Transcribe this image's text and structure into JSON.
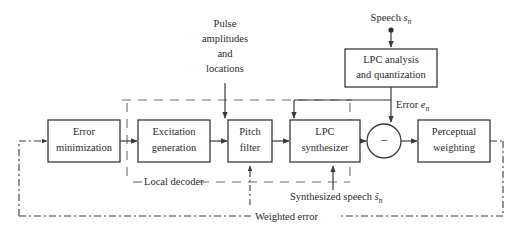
{
  "figure": {
    "type": "block-diagram",
    "title_text": "",
    "stroke_color": "#3a3a3a",
    "text_color": "#2b2b2b",
    "background": "#ffffff"
  },
  "blocks": [
    {
      "id": "error-minimization",
      "line1": "Error",
      "line2": "minimization",
      "x": 48,
      "y": 120,
      "w": 72,
      "h": 42
    },
    {
      "id": "excitation-generation",
      "line1": "Excitation",
      "line2": "generation",
      "x": 138,
      "y": 120,
      "w": 72,
      "h": 42
    },
    {
      "id": "pitch-filter",
      "line1": "Pitch",
      "line2": "filter",
      "x": 228,
      "y": 120,
      "w": 44,
      "h": 42
    },
    {
      "id": "lpc-synthesizer",
      "line1": "LPC",
      "line2": "synthesizer",
      "x": 290,
      "y": 120,
      "w": 70,
      "h": 42
    },
    {
      "id": "perceptual-weighting",
      "line1": "Perceptual",
      "line2": "weighting",
      "x": 418,
      "y": 120,
      "w": 72,
      "h": 42
    },
    {
      "id": "lpc-analysis",
      "line1": "LPC analysis",
      "line2": "and quantization",
      "x": 345,
      "y": 49,
      "w": 92,
      "h": 38
    }
  ],
  "adder": {
    "id": "summing-junction",
    "cx": 384,
    "cy": 141,
    "r": 17,
    "sign": "−"
  },
  "annotations": {
    "pulse_amplitudes": {
      "lines": [
        "Pulse",
        "amplitudes",
        "and",
        "locations"
      ],
      "x": 225,
      "y": 41
    },
    "speech_input": {
      "text": "Speech ",
      "symbol": "s",
      "subscript": "n",
      "x": 364,
      "y": 20
    },
    "error_signal": {
      "text": "Error ",
      "symbol": "e",
      "subscript": "n",
      "x": 396,
      "y": 107
    },
    "synthesized_speech": {
      "text": "Synthesized speech ",
      "symbol": "ŝ",
      "subscript": "n",
      "x": 337,
      "y": 199
    },
    "local_decoder": {
      "text": "Local decoder",
      "x": 141,
      "y": 181
    },
    "weighted_error": {
      "text": "Weighted error",
      "x": 259,
      "y": 216
    }
  },
  "connections": [
    {
      "id": "error-min-to-excitation",
      "style": "solid-arrow"
    },
    {
      "id": "excitation-to-pitch",
      "style": "solid-arrow"
    },
    {
      "id": "pitch-to-lpc-synth",
      "style": "solid-arrow"
    },
    {
      "id": "lpc-synth-to-adder",
      "style": "solid-arrow"
    },
    {
      "id": "adder-to-perceptual",
      "style": "solid-arrow"
    },
    {
      "id": "speech-to-lpc-analysis",
      "style": "solid-arrow"
    },
    {
      "id": "lpc-analysis-to-lpc-synth",
      "style": "solid-arrow"
    },
    {
      "id": "lpc-analysis-to-adder",
      "style": "solid-arrow"
    },
    {
      "id": "pulse-params-to-pitch",
      "style": "solid-arrow"
    },
    {
      "id": "synthesized-speech-tap-to-adder",
      "style": "solid-arrow"
    },
    {
      "id": "pitch-filter-dashdot-feedback",
      "style": "dash-dot-arrow"
    },
    {
      "id": "weighted-error-feedback",
      "style": "dash-dot-arrow"
    },
    {
      "id": "local-decoder-boundary",
      "style": "dashed-box"
    }
  ]
}
